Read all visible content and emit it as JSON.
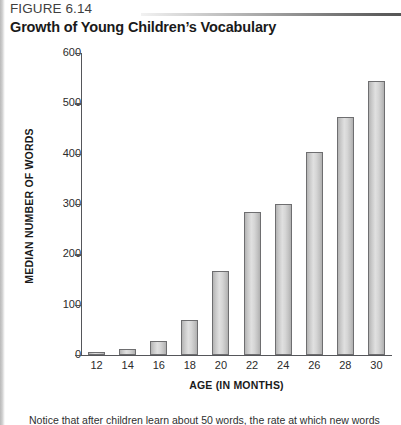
{
  "figure": {
    "number": "FIGURE 6.14",
    "title": "Growth of Young Children’s Vocabulary",
    "caption": "Notice that after children learn about 50 words, the rate at which new words are"
  },
  "chart_data": {
    "type": "bar",
    "title": "Growth of Young Children’s Vocabulary",
    "xlabel": "AGE (IN MONTHS)",
    "ylabel": "MEDIAN NUMBER OF WORDS",
    "categories": [
      "12",
      "14",
      "16",
      "18",
      "20",
      "22",
      "24",
      "26",
      "28",
      "30"
    ],
    "values": [
      6,
      11,
      28,
      70,
      167,
      285,
      300,
      403,
      473,
      545
    ],
    "ylim": [
      0,
      600
    ],
    "yticks": [
      0,
      100,
      200,
      300,
      400,
      500,
      600
    ],
    "grid": false,
    "legend": null,
    "bar_fill": "#d6d6d6",
    "bar_border": "#6e6e70"
  }
}
